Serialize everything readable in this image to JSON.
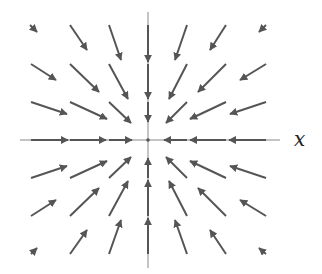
{
  "diagram": {
    "type": "vector-field",
    "axis_label_x": "x",
    "colors": {
      "arrow": "#555555",
      "axis": "#888888"
    },
    "origin": [
      148,
      140
    ],
    "axes": {
      "horizontal": {
        "x1": 20,
        "x2": 280,
        "y": 140
      },
      "vertical": {
        "x": 148,
        "y1": 12,
        "y2": 268
      }
    },
    "arrows": [
      {
        "x1": 30,
        "y1": 25,
        "x2": 37,
        "y2": 32
      },
      {
        "x1": 70,
        "y1": 25,
        "x2": 87,
        "y2": 50
      },
      {
        "x1": 109,
        "y1": 25,
        "x2": 121,
        "y2": 60
      },
      {
        "x1": 187,
        "y1": 25,
        "x2": 175,
        "y2": 60
      },
      {
        "x1": 226,
        "y1": 25,
        "x2": 210,
        "y2": 50
      },
      {
        "x1": 266,
        "y1": 25,
        "x2": 259,
        "y2": 32
      },
      {
        "x1": 31,
        "y1": 64,
        "x2": 56,
        "y2": 80
      },
      {
        "x1": 70,
        "y1": 64,
        "x2": 99,
        "y2": 92
      },
      {
        "x1": 109,
        "y1": 64,
        "x2": 128,
        "y2": 99
      },
      {
        "x1": 187,
        "y1": 64,
        "x2": 169,
        "y2": 99
      },
      {
        "x1": 226,
        "y1": 64,
        "x2": 198,
        "y2": 92
      },
      {
        "x1": 266,
        "y1": 64,
        "x2": 240,
        "y2": 80
      },
      {
        "x1": 31,
        "y1": 102,
        "x2": 67,
        "y2": 114
      },
      {
        "x1": 70,
        "y1": 102,
        "x2": 107,
        "y2": 119
      },
      {
        "x1": 109,
        "y1": 102,
        "x2": 131,
        "y2": 123
      },
      {
        "x1": 187,
        "y1": 102,
        "x2": 166,
        "y2": 123
      },
      {
        "x1": 226,
        "y1": 102,
        "x2": 190,
        "y2": 119
      },
      {
        "x1": 266,
        "y1": 102,
        "x2": 230,
        "y2": 114
      },
      {
        "x1": 31,
        "y1": 178,
        "x2": 67,
        "y2": 166
      },
      {
        "x1": 70,
        "y1": 178,
        "x2": 107,
        "y2": 161
      },
      {
        "x1": 109,
        "y1": 178,
        "x2": 131,
        "y2": 157
      },
      {
        "x1": 187,
        "y1": 178,
        "x2": 166,
        "y2": 157
      },
      {
        "x1": 226,
        "y1": 178,
        "x2": 190,
        "y2": 161
      },
      {
        "x1": 266,
        "y1": 178,
        "x2": 230,
        "y2": 166
      },
      {
        "x1": 31,
        "y1": 216,
        "x2": 56,
        "y2": 200
      },
      {
        "x1": 70,
        "y1": 216,
        "x2": 99,
        "y2": 188
      },
      {
        "x1": 109,
        "y1": 216,
        "x2": 128,
        "y2": 181
      },
      {
        "x1": 187,
        "y1": 216,
        "x2": 169,
        "y2": 181
      },
      {
        "x1": 226,
        "y1": 216,
        "x2": 198,
        "y2": 188
      },
      {
        "x1": 266,
        "y1": 216,
        "x2": 240,
        "y2": 200
      },
      {
        "x1": 31,
        "y1": 254,
        "x2": 37,
        "y2": 248
      },
      {
        "x1": 70,
        "y1": 254,
        "x2": 87,
        "y2": 230
      },
      {
        "x1": 109,
        "y1": 254,
        "x2": 121,
        "y2": 220
      },
      {
        "x1": 187,
        "y1": 254,
        "x2": 175,
        "y2": 220
      },
      {
        "x1": 226,
        "y1": 254,
        "x2": 210,
        "y2": 230
      },
      {
        "x1": 266,
        "y1": 254,
        "x2": 259,
        "y2": 248
      }
    ],
    "axis_arrows": [
      {
        "x1": 31,
        "y1": 140,
        "x2": 68,
        "y2": 140
      },
      {
        "x1": 70,
        "y1": 140,
        "x2": 106,
        "y2": 140
      },
      {
        "x1": 109,
        "y1": 140,
        "x2": 132,
        "y2": 140
      },
      {
        "x1": 266,
        "y1": 140,
        "x2": 229,
        "y2": 140
      },
      {
        "x1": 226,
        "y1": 140,
        "x2": 190,
        "y2": 140
      },
      {
        "x1": 187,
        "y1": 140,
        "x2": 164,
        "y2": 140
      },
      {
        "x1": 148,
        "y1": 25,
        "x2": 148,
        "y2": 62
      },
      {
        "x1": 148,
        "y1": 64,
        "x2": 148,
        "y2": 99
      },
      {
        "x1": 148,
        "y1": 102,
        "x2": 148,
        "y2": 122
      },
      {
        "x1": 148,
        "y1": 254,
        "x2": 148,
        "y2": 218
      },
      {
        "x1": 148,
        "y1": 216,
        "x2": 148,
        "y2": 180
      },
      {
        "x1": 148,
        "y1": 178,
        "x2": 148,
        "y2": 158
      }
    ]
  }
}
